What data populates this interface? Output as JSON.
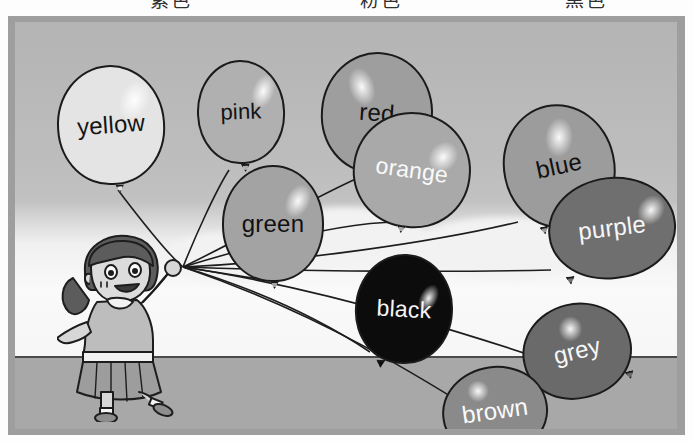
{
  "header": {
    "cut_glyphs": [
      {
        "text": "紫色",
        "x": 150
      },
      {
        "text": "粉色",
        "x": 360
      },
      {
        "text": "黑色",
        "x": 565
      }
    ]
  },
  "scene": {
    "title": "balloons-color-vocabulary-illustration",
    "character": "girl-holding-balloons",
    "frame_color": "#9e9e9e",
    "sky_color": "#bdbdbd",
    "ground_color": "#a8a8a8"
  },
  "balloons": [
    {
      "id": "yellow",
      "label": "yellow",
      "x": 42,
      "y": 43,
      "w": 108,
      "h": 120,
      "fill": "#e4e4e4",
      "text_color": "#151515",
      "font_size": 24,
      "rot": -4,
      "knot_x": 52,
      "knot_y": 118,
      "shine_x": 62,
      "shine_y": 14,
      "shine_w": 30,
      "shine_h": 42,
      "shine_rot": 28
    },
    {
      "id": "pink",
      "label": "pink",
      "x": 182,
      "y": 38,
      "w": 88,
      "h": 104,
      "fill": "#b0b0b0",
      "text_color": "#131313",
      "font_size": 22,
      "rot": -2,
      "knot_x": 40,
      "knot_y": 102,
      "shine_x": 54,
      "shine_y": 12,
      "shine_w": 22,
      "shine_h": 36,
      "shine_rot": 22
    },
    {
      "id": "red",
      "label": "red",
      "x": 306,
      "y": 30,
      "w": 112,
      "h": 122,
      "fill": "#9e9e9e",
      "text_color": "#121212",
      "font_size": 24,
      "rot": 4,
      "knot_x": 44,
      "knot_y": 119,
      "shine_x": 24,
      "shine_y": 14,
      "shine_w": 26,
      "shine_h": 40,
      "shine_rot": -22
    },
    {
      "id": "orange",
      "label": "orange",
      "x": 338,
      "y": 90,
      "w": 118,
      "h": 116,
      "fill": "#a9a9a9",
      "text_color": "#fafafa",
      "font_size": 23,
      "rot": 8,
      "knot_x": 50,
      "knot_y": 112,
      "shine_x": 72,
      "shine_y": 22,
      "shine_w": 28,
      "shine_h": 34,
      "shine_rot": 30
    },
    {
      "id": "green",
      "label": "green",
      "x": 207,
      "y": 143,
      "w": 102,
      "h": 117,
      "fill": "#a3a3a3",
      "text_color": "#111111",
      "font_size": 24,
      "rot": 0,
      "knot_x": 46,
      "knot_y": 114,
      "shine_x": 62,
      "shine_y": 16,
      "shine_w": 24,
      "shine_h": 36,
      "shine_rot": 26
    },
    {
      "id": "blue",
      "label": "blue",
      "x": 488,
      "y": 82,
      "w": 112,
      "h": 124,
      "fill": "#9c9c9c",
      "text_color": "#111111",
      "font_size": 24,
      "rot": -12,
      "knot_x": 22,
      "knot_y": 116,
      "shine_x": 46,
      "shine_y": 12,
      "shine_w": 28,
      "shine_h": 40,
      "shine_rot": 16
    },
    {
      "id": "purple",
      "label": "purple",
      "x": 533,
      "y": 155,
      "w": 128,
      "h": 102,
      "fill": "#6f6f6f",
      "text_color": "#f7f7f7",
      "font_size": 24,
      "rot": -7,
      "knot_x": 10,
      "knot_y": 92,
      "shine_x": 90,
      "shine_y": 20,
      "shine_w": 26,
      "shine_h": 32,
      "shine_rot": 40
    },
    {
      "id": "black",
      "label": "black",
      "x": 340,
      "y": 232,
      "w": 98,
      "h": 110,
      "fill": "#0c0c0c",
      "text_color": "#f5f5f5",
      "font_size": 23,
      "rot": 3,
      "knot_x": 22,
      "knot_y": 105,
      "shine_x": 62,
      "shine_y": 26,
      "shine_w": 18,
      "shine_h": 30,
      "shine_rot": 24
    },
    {
      "id": "grey",
      "label": "grey",
      "x": 507,
      "y": 281,
      "w": 110,
      "h": 96,
      "fill": "#6a6a6a",
      "text_color": "#f7f7f7",
      "font_size": 24,
      "rot": -14,
      "knot_x": 94,
      "knot_y": 78,
      "shine_x": 40,
      "shine_y": 10,
      "shine_w": 24,
      "shine_h": 26,
      "shine_rot": 18
    },
    {
      "id": "brown",
      "label": "brown",
      "x": 427,
      "y": 344,
      "w": 106,
      "h": 90,
      "fill": "#8a8a8a",
      "text_color": "#fbfbfb",
      "font_size": 24,
      "rot": -8,
      "knot_x": 88,
      "knot_y": 76,
      "shine_x": 26,
      "shine_y": 10,
      "shine_w": 22,
      "shine_h": 22,
      "shine_rot": 12
    }
  ],
  "strings": {
    "anchor_x": 168,
    "anchor_y": 245,
    "paths": [
      "M168,245 C150,230 120,190 103,168",
      "M168,245 C180,215 200,170 214,148",
      "M168,245 C230,215 300,175 343,156",
      "M168,245 C250,220 330,200 383,200",
      "M168,245 C200,250 230,255 250,258",
      "M168,245 C280,240 420,220 503,200",
      "M168,245 C300,250 450,250 536,248",
      "M168,245 C250,270 310,300 355,330",
      "M168,245 C320,268 480,320 595,360",
      "M168,245 C300,290 400,350 508,420"
    ]
  }
}
